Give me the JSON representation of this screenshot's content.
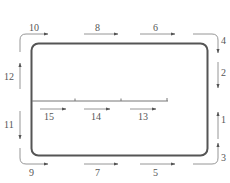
{
  "diagram": {
    "type": "flow-sequence",
    "colors": {
      "frame": "#555555",
      "arrows": "#8a8a8a",
      "labels": "#555555",
      "background": "#ffffff"
    },
    "labels": {
      "a1": "1",
      "a2": "2",
      "a3": "3",
      "a4": "4",
      "a5": "5",
      "a6": "6",
      "a7": "7",
      "a8": "8",
      "a9": "9",
      "a10": "10",
      "a11": "11",
      "a12": "12",
      "a13": "13",
      "a14": "14",
      "a15": "15"
    },
    "arrows": [
      {
        "id": "1",
        "side": "right",
        "direction": "up"
      },
      {
        "id": "2",
        "side": "right",
        "direction": "down"
      },
      {
        "id": "3",
        "side": "bottom-right-corner",
        "direction": "right-then-up"
      },
      {
        "id": "4",
        "side": "top-right-corner",
        "direction": "right-then-down"
      },
      {
        "id": "5",
        "side": "bottom",
        "direction": "right"
      },
      {
        "id": "6",
        "side": "top",
        "direction": "right"
      },
      {
        "id": "7",
        "side": "bottom",
        "direction": "right"
      },
      {
        "id": "8",
        "side": "top",
        "direction": "right"
      },
      {
        "id": "9",
        "side": "bottom-left-corner",
        "direction": "down-then-right"
      },
      {
        "id": "10",
        "side": "top-left-corner",
        "direction": "up-then-right"
      },
      {
        "id": "11",
        "side": "left",
        "direction": "down"
      },
      {
        "id": "12",
        "side": "left",
        "direction": "up"
      },
      {
        "id": "13",
        "side": "interior-line",
        "direction": "right"
      },
      {
        "id": "14",
        "side": "interior-line",
        "direction": "right"
      },
      {
        "id": "15",
        "side": "interior-line",
        "direction": "right"
      }
    ]
  }
}
